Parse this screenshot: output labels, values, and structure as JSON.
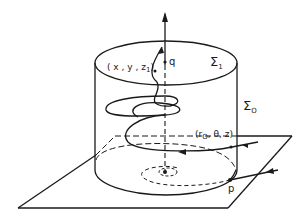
{
  "figure": {
    "labels": {
      "sigma1": "Σ",
      "sigma1_sub": "1",
      "sigma0": "Σ",
      "sigma0_sub": "O",
      "point_q": "q",
      "point_p": "p",
      "top_point_prefix": "( x , y , z",
      "top_point_sub": "1",
      "top_point_suffix": ")",
      "side_point_prefix": "(r",
      "side_point_sub": "O",
      "side_point_suffix": ", θ, z)"
    },
    "colors": {
      "stroke": "#1a1a1a",
      "background": "#ffffff"
    }
  }
}
